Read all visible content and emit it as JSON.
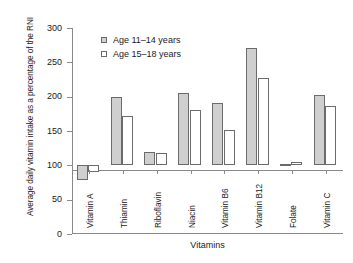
{
  "chart_data": {
    "type": "bar",
    "title": "",
    "xlabel": "Vitamins",
    "ylabel": "Average daily vitamin intake as a percentage of the RNI",
    "categories": [
      "Vitamin A",
      "Thiamin",
      "Riboflavin",
      "Niacin",
      "Vitamin B6",
      "Vitamin B12",
      "Folate",
      "Vitamin C"
    ],
    "series": [
      {
        "name": "Age 11–14 years",
        "color": "#cfcfcf",
        "values": [
          78,
          200,
          120,
          206,
          191,
          271,
          102,
          203
        ]
      },
      {
        "name": "Age 15–18 years",
        "color": "#ffffff",
        "values": [
          91,
          172,
          118,
          181,
          151,
          227,
          105,
          186
        ]
      }
    ],
    "ylim": [
      0,
      300
    ],
    "yticks": [
      0,
      50,
      100,
      150,
      200,
      250,
      300
    ],
    "ytick_labels": [
      "0",
      "50",
      "100",
      "150",
      "200",
      "250",
      "300"
    ],
    "grid": false,
    "reference_line": 100,
    "legend_position": "top-left-inside"
  },
  "axes": {
    "y_title": "Average daily vitamin intake as a percentage of the RNI",
    "x_title": "Vitamins"
  },
  "legend": {
    "entries": [
      {
        "label": "Age 11–14 years",
        "swatch": "filled-gray"
      },
      {
        "label": "Age 15–18 years",
        "swatch": "open-white"
      }
    ]
  }
}
